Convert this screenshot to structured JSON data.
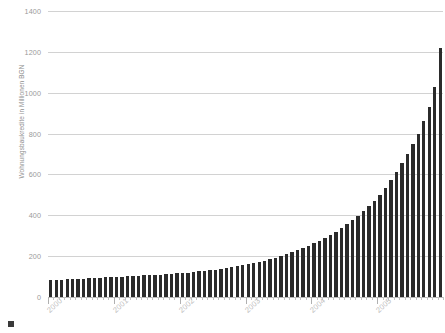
{
  "chart_data": {
    "type": "bar",
    "title": "",
    "subtitle": "",
    "xlabel": "",
    "ylabel": "Wohnungsbaukredite in Millionen BGN",
    "ylim": [
      0,
      1400
    ],
    "yticks": [
      0,
      200,
      400,
      600,
      800,
      1000,
      1200,
      1400
    ],
    "ytick_labels": [
      "0",
      "200",
      "400",
      "600",
      "800",
      "1000",
      "1200",
      "1400"
    ],
    "grid": true,
    "legend": "",
    "bar_color": "#2b2b2b",
    "grid_color": "#d2d2d2",
    "axis_text_color": "#9a9a9a",
    "x_label_color": "#bdbdbd",
    "xtick_labels": [
      "2000",
      "2001",
      "2002",
      "2003",
      "2004",
      "2005"
    ],
    "x_major_tick_indices": [
      0,
      12,
      24,
      36,
      48,
      60
    ],
    "categories": [
      "2000-01",
      "2000-02",
      "2000-03",
      "2000-04",
      "2000-05",
      "2000-06",
      "2000-07",
      "2000-08",
      "2000-09",
      "2000-10",
      "2000-11",
      "2000-12",
      "2001-01",
      "2001-02",
      "2001-03",
      "2001-04",
      "2001-05",
      "2001-06",
      "2001-07",
      "2001-08",
      "2001-09",
      "2001-10",
      "2001-11",
      "2001-12",
      "2002-01",
      "2002-02",
      "2002-03",
      "2002-04",
      "2002-05",
      "2002-06",
      "2002-07",
      "2002-08",
      "2002-09",
      "2002-10",
      "2002-11",
      "2002-12",
      "2003-01",
      "2003-02",
      "2003-03",
      "2003-04",
      "2003-05",
      "2003-06",
      "2003-07",
      "2003-08",
      "2003-09",
      "2003-10",
      "2003-11",
      "2003-12",
      "2004-01",
      "2004-02",
      "2004-03",
      "2004-04",
      "2004-05",
      "2004-06",
      "2004-07",
      "2004-08",
      "2004-09",
      "2004-10",
      "2004-11",
      "2004-12",
      "2005-01",
      "2005-02",
      "2005-03",
      "2005-04",
      "2005-05",
      "2005-06",
      "2005-07",
      "2005-08",
      "2005-09",
      "2005-10",
      "2005-11",
      "2005-12"
    ],
    "values": [
      82,
      84,
      85,
      86,
      88,
      89,
      90,
      92,
      93,
      94,
      96,
      98,
      99,
      100,
      101,
      103,
      104,
      106,
      107,
      109,
      110,
      112,
      114,
      116,
      118,
      120,
      122,
      125,
      128,
      131,
      134,
      138,
      142,
      146,
      150,
      155,
      160,
      166,
      172,
      178,
      185,
      192,
      200,
      209,
      218,
      228,
      238,
      250,
      262,
      275,
      289,
      304,
      320,
      337,
      356,
      376,
      398,
      421,
      446,
      472,
      500,
      535,
      572,
      612,
      655,
      700,
      748,
      800,
      860,
      930,
      1030,
      1220
    ]
  },
  "legend_marker": {
    "name": "legend-swatch",
    "color": "#3a3a3a"
  }
}
